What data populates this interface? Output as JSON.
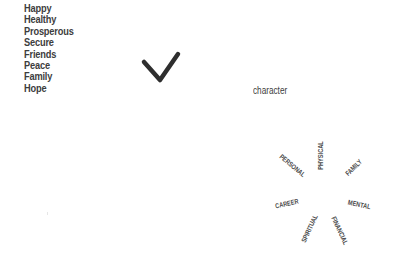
{
  "word_list": [
    "Happy",
    "Healthy",
    "Prosperous",
    "Secure",
    "Friends",
    "Peace",
    "Family",
    "Hope"
  ],
  "checkmark": {
    "icon": "checkmark-icon",
    "color": "#2e2e2e"
  },
  "caption": "character",
  "radial_words": [
    {
      "label": "PHYSICAL",
      "x": 321,
      "y": 155,
      "angle": -90
    },
    {
      "label": "PERSONAL",
      "x": 292,
      "y": 165,
      "angle": 40
    },
    {
      "label": "FAMILY",
      "x": 354,
      "y": 167,
      "angle": -45
    },
    {
      "label": "CAREER",
      "x": 287,
      "y": 203,
      "angle": -12
    },
    {
      "label": "MENTAL",
      "x": 359,
      "y": 204,
      "angle": 12
    },
    {
      "label": "SPIRITUAL",
      "x": 309,
      "y": 228,
      "angle": -65
    },
    {
      "label": "FINANCIAL",
      "x": 340,
      "y": 230,
      "angle": 65
    }
  ]
}
